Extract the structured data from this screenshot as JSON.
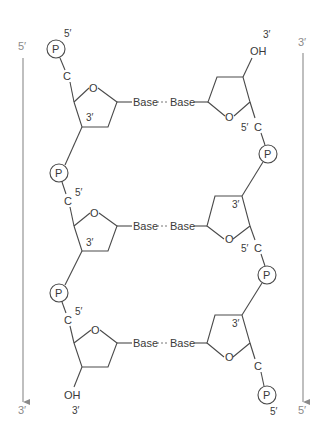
{
  "diagram": {
    "title": "",
    "labels": {
      "phosphate": "P",
      "carbon": "C",
      "oxygen": "O",
      "hydroxyl": "OH",
      "base": "Base",
      "five_prime": "5′",
      "three_prime": "3′"
    },
    "left_strand": {
      "direction_top": "5′",
      "direction_bottom": "3′",
      "top_end": "5′",
      "bottom_end": "3′"
    },
    "right_strand": {
      "direction_top": "3′",
      "direction_bottom": "5′",
      "top_end": "3′",
      "bottom_end": "5′"
    },
    "base_pairs": [
      {
        "left": "Base",
        "right": "Base"
      },
      {
        "left": "Base",
        "right": "Base"
      },
      {
        "left": "Base",
        "right": "Base"
      }
    ],
    "colors": {
      "line": "#4a4a4a",
      "arrow": "#8a8a8a",
      "text": "#3a3a3a"
    }
  }
}
